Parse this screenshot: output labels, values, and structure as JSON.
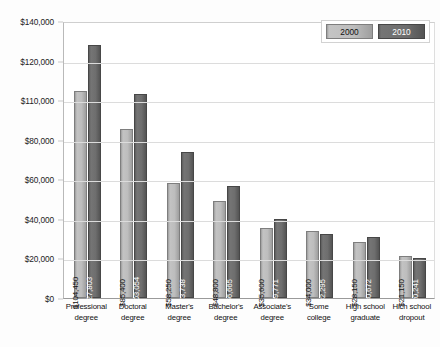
{
  "chart_data": {
    "type": "bar",
    "title": "",
    "xlabel": "",
    "ylabel": "",
    "grid": true,
    "legend_position": "top-right",
    "categories": [
      "Professional degree",
      "Doctoral degree",
      "Master's degree",
      "Bachelor's degree",
      "Associate's degree",
      "Some college",
      "High school graduate",
      "Hich school dropout"
    ],
    "category_lines": [
      [
        "Professional",
        "degree"
      ],
      [
        "Doctoral",
        "degree"
      ],
      [
        "Master's",
        "degree"
      ],
      [
        "Bachelor's",
        "degree"
      ],
      [
        "Associate's",
        "degree"
      ],
      [
        "Some",
        "college"
      ],
      [
        "High school",
        "graduate"
      ],
      [
        "Hich school",
        "dropout"
      ]
    ],
    "series": [
      {
        "name": "2000",
        "color": "#bdbdbd",
        "values": [
          104450,
          85400,
          58250,
          48800,
          35600,
          34000,
          28150,
          21150
        ],
        "labels": [
          "$104,450",
          "$85,400",
          "$58,250",
          "$48,800",
          "$35,600",
          "$34,000",
          "$28,150",
          "$21,150"
        ]
      },
      {
        "name": "2010",
        "color": "#6e6e6e",
        "values": [
          127803,
          103054,
          73738,
          56665,
          39771,
          32295,
          30672,
          20241
        ],
        "labels": [
          "$127,803",
          "$103,054",
          "$73,738",
          "$56,665",
          "$39,771",
          "$32,295",
          "$30,672",
          "$20,241"
        ]
      }
    ],
    "ylim": [
      0,
      140000
    ],
    "ytick_labels": [
      "$140,000",
      "$120,000",
      "$110,000",
      "$80,000",
      "$60,000",
      "$40,000",
      "$20,000",
      "$0"
    ],
    "ytick_values": [
      140000,
      120000,
      100000,
      80000,
      60000,
      40000,
      20000,
      0
    ]
  },
  "legend": {
    "items": [
      {
        "label": "2000"
      },
      {
        "label": "2010"
      }
    ]
  }
}
